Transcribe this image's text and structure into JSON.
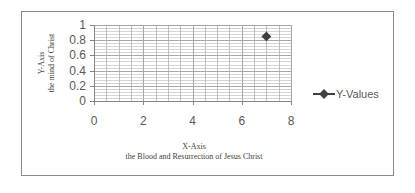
{
  "chart_data": {
    "type": "scatter",
    "title": "",
    "xlabel": "X-Axis",
    "xlabel_sub": "the Blood and Resurrection of Jesus Christ",
    "ylabel": "Y-Axis",
    "ylabel_sub": "the mind of Christ",
    "xlim": [
      0,
      8
    ],
    "ylim": [
      0,
      1
    ],
    "x_ticks": [
      "0",
      "2",
      "4",
      "6",
      "8"
    ],
    "y_ticks": [
      "0",
      "0.2",
      "0.4",
      "0.6",
      "0.8",
      "1"
    ],
    "grid": true,
    "legend_position": "right",
    "series": [
      {
        "name": "Y-Values",
        "x": [
          7
        ],
        "y": [
          0.85
        ],
        "color": "#404040",
        "marker": "diamond"
      }
    ]
  },
  "colors": {
    "grid": "#a6a6a6",
    "axis": "#868686",
    "frame": "#8a8a8a"
  }
}
